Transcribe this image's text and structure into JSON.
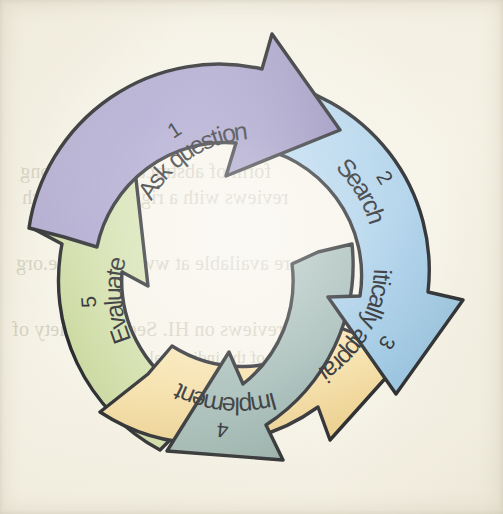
{
  "page": {
    "background_color": "#f6f3e7",
    "type": "scanned-book-figure",
    "outline_color": "#1a1c20"
  },
  "diagram": {
    "name": "evidence-based-practice-cycle",
    "shape": "circular-cycle",
    "direction": "clockwise",
    "step_count": 5,
    "center": {
      "x": 251,
      "y": 258
    },
    "steps": [
      {
        "number": "1",
        "label": "Ask question",
        "color": "#a9a2cd",
        "color_dark": "#8f87b8",
        "angle_start": -118,
        "angle_end": -38
      },
      {
        "number": "2",
        "label": "Search",
        "color": "#a9cfe9",
        "color_dark": "#8fbcdd",
        "angle_start": -42,
        "angle_end": 28
      },
      {
        "number": "3",
        "label": "Critically appraise",
        "color": "#9db6b1",
        "color_dark": "#87a49e",
        "angle_start": 24,
        "angle_end": 96
      },
      {
        "number": "4",
        "label": "Implement",
        "color": "#f6dfa4",
        "color_dark": "#e8cc86",
        "angle_start": 92,
        "angle_end": 164
      },
      {
        "number": "5",
        "label": "Evaluate",
        "color": "#cfdda5",
        "color_dark": "#bdce8c",
        "angle_start": 160,
        "angle_end": 238
      }
    ]
  },
  "ghost_text": {
    "description": "faint mirrored show-through text from the reverse side of the scanned page",
    "color": "#b9b4a0",
    "lines": [
      {
        "text": "form of abstracts with a strong",
        "x": 20,
        "y": 160,
        "size": 20
      },
      {
        "text": "reviews with a rigorous research",
        "x": 22,
        "y": 186,
        "size": 20
      },
      {
        "text": "are available at www.cochrane.org",
        "x": 16,
        "y": 252,
        "size": 20
      },
      {
        "text": "reviews on HI. Sed the variety of",
        "x": 12,
        "y": 318,
        "size": 20
      },
      {
        "text": "of the individual studies",
        "x": 96,
        "y": 348,
        "size": 17
      }
    ]
  }
}
